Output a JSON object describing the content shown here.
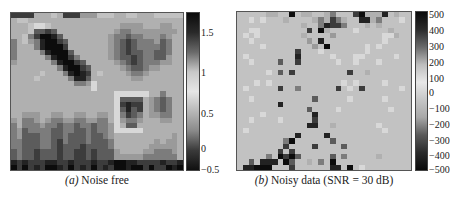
{
  "figure": {
    "panels": [
      {
        "id": "a",
        "label": "(a)",
        "caption": "Noise free",
        "colorbar": {
          "ticks": [
            "1.5",
            "1",
            "0.5",
            "0",
            "−0.5"
          ],
          "tick_pos": [
            0.14,
            0.39,
            0.65,
            0.87,
            1.0
          ],
          "min": -0.8,
          "max": 1.7,
          "gradient": [
            "#0b0b0b",
            "#2a2a2a",
            "#6a6a6a",
            "#c8c8c8",
            "#e6e6e6",
            "#b8b8b8",
            "#8a8a8a",
            "#3a3a3a",
            "#101010"
          ]
        },
        "rows": [
          "777733323777444222332233322222",
          "322333333333333333333333333333",
          "333211233333333333344443334433",
          "333266763333333333455444444443",
          "332579986333333334556554445433",
          "532458997633333334567655546533",
          "53335899973333333456765555653",
          "533335899963333334567665566533",
          "533333589975333334566765566433",
          "433333358997633333456765554433",
          "333333335899763333345665443333",
          "333332333589873233334554333333",
          "333323333358863333333443333333",
          "333333333335541333333333333333",
          "333333333333331333333333333333",
          "333333333333333333111111335333",
          "333333333333333333166663456533",
          "333333333333333333178773456533",
          "333333333333333333168673456533",
          "334443344334433443157653445533",
          "435543455445544553145543334433",
          "535554556556556554136633333333",
          "546555566556656554111113333333",
          "546665566566656654333333333343",
          "556665567566656665333333343443",
          "556665567666766665333333444443",
          "656676667667767666433334455543",
          "656676667667767666444445555553",
          "878777887787778778998877778778",
          "979787998797879787998997977989"
        ]
      },
      {
        "id": "b",
        "label": "(b)",
        "caption": "Noisy data (SNR = 30 dB)",
        "colorbar": {
          "ticks": [
            "500",
            "400",
            "300",
            "200",
            "100",
            "0",
            "−100",
            "−200",
            "−300",
            "−400",
            "−500"
          ],
          "tick_pos": [
            0.03,
            0.13,
            0.23,
            0.33,
            0.43,
            0.52,
            0.62,
            0.72,
            0.82,
            0.91,
            1.0
          ],
          "min": -520,
          "max": 520,
          "gradient": [
            "#0a0a0a",
            "#2b2b2b",
            "#6a6a6a",
            "#bdbdbd",
            "#e8e8e8",
            "#c6c6c6",
            "#a8a8a8",
            "#5a5a5a",
            "#2a2a2a",
            "#0a0a0a"
          ]
        },
        "rows": [
          "222223322923322352227933382322",
          "221212223222235375322883522212",
          "222222222223225877522232322222",
          "221122222222729322221222223222",
          "212122222223222242222222211322",
          "221222222222428222222222212222",
          "222212222222242922222212122222",
          "222222222272221222222212222222",
          "212222222282222212221122222122",
          "221222262272222221221222122222",
          "222222222222222222222222222222",
          "222221262722222222272232222222",
          "222222222222222222222222222222",
          "222121222222222222121222212222",
          "212222272252222227212722222212",
          "222222222222222222222222222222",
          "221222222222262222212222212222",
          "222222282222222222222222222222",
          "222222222222622221222222221222",
          "222212222222282222222222222222",
          "221222212222272222222222222222",
          "222222222222882232222222122222",
          "212222222222222222222222212222",
          "222222222282222822222222222222",
          "222222225922222262222222222222",
          "222222227222272222622222222222",
          "222222272722222222222222222222",
          "222225297962222262522222322222",
          "226288829622325292222222222222",
          "288999222722222288292122222222"
        ]
      }
    ],
    "caption_cut": "Figure 5.3.10  (a) Noise free; (b) Noisy data"
  }
}
